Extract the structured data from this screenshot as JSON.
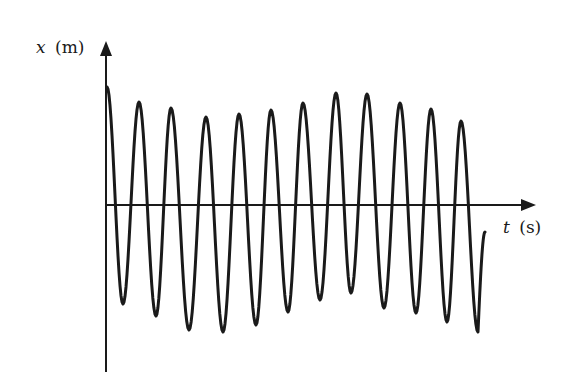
{
  "chart_data": {
    "type": "line",
    "title": "",
    "xlabel": "t (s)",
    "ylabel": "x (m)",
    "xlabel_var": "t",
    "xlabel_unit": "(s)",
    "ylabel_var": "x",
    "ylabel_unit": "(m)",
    "grid": false,
    "legend": null,
    "ticks": "none",
    "series": [
      {
        "name": "x(t)",
        "color": "#1a1a1a",
        "extrema_pixels": [
          [
            107,
            87
          ],
          [
            123,
            304
          ],
          [
            139,
            102
          ],
          [
            156,
            316
          ],
          [
            171,
            108
          ],
          [
            189,
            330
          ],
          [
            206,
            117
          ],
          [
            223,
            332
          ],
          [
            239,
            114
          ],
          [
            256,
            325
          ],
          [
            271,
            110
          ],
          [
            288,
            312
          ],
          [
            303,
            103
          ],
          [
            320,
            300
          ],
          [
            336,
            93
          ],
          [
            351,
            293
          ],
          [
            367,
            94
          ],
          [
            384,
            308
          ],
          [
            400,
            103
          ],
          [
            416,
            313
          ],
          [
            431,
            109
          ],
          [
            447,
            322
          ],
          [
            461,
            121
          ],
          [
            478,
            332
          ],
          [
            485,
            232
          ]
        ],
        "relative_amplitudes_peaks": [
          1.0,
          0.88,
          0.84,
          0.75,
          0.78,
          0.81,
          0.86,
          0.95,
          0.94,
          0.86,
          0.81,
          0.71
        ],
        "relative_amplitudes_troughs": [
          0.85,
          0.95,
          1.06,
          1.07,
          1.02,
          0.92,
          0.81,
          0.75,
          0.88,
          0.92,
          0.99,
          1.07
        ]
      }
    ],
    "axes": {
      "origin_px": [
        106,
        205
      ],
      "x_axis_end_px": 535,
      "y_axis_top_px": 43,
      "y_axis_bottom_px": 372
    }
  }
}
